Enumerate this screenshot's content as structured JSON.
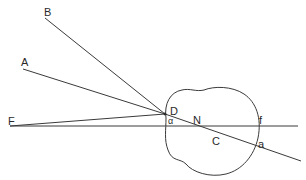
{
  "diagram": {
    "type": "optics-eye-ray-diagram",
    "labels": {
      "A": "A",
      "B": "B",
      "F": "F",
      "D": "D",
      "alpha": "α",
      "N": "N",
      "C": "C",
      "f": "f",
      "a": "a"
    },
    "colors": {
      "line": "#3a3a3a",
      "text": "#2a2a2a",
      "background": "#ffffff"
    }
  }
}
